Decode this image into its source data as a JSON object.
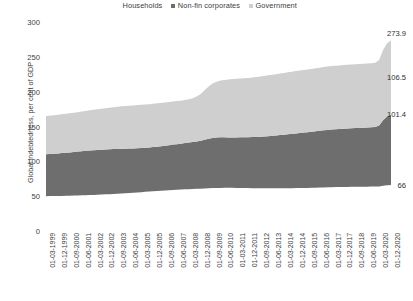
{
  "legend": {
    "position": "top-center",
    "items": [
      {
        "label": "Households",
        "color": "#ffffff",
        "swatch_name": "legend-swatch-households"
      },
      {
        "label": "Non-fin corporates",
        "color": "#6e6e6e",
        "swatch_name": "legend-swatch-non-fin-corporates"
      },
      {
        "label": "Government",
        "color": "#cfcfcf",
        "swatch_name": "legend-swatch-government"
      }
    ]
  },
  "axes": {
    "ylabel": "Global indebtedness, per cent of GDP",
    "yticks": [
      "300",
      "250",
      "200",
      "150",
      "100",
      "50",
      "0"
    ],
    "ylim": [
      0,
      300
    ],
    "xlabel": ""
  },
  "callouts": [
    {
      "name": "callout-total",
      "value": "273.9"
    },
    {
      "name": "callout-government",
      "value": "106.5"
    },
    {
      "name": "callout-non-fin-corporates",
      "value": "101.4"
    },
    {
      "name": "callout-households",
      "value": "66"
    }
  ],
  "chart_data": {
    "type": "area",
    "stacked": true,
    "title": "",
    "xlabel": "",
    "ylabel": "Global indebtedness, per cent of GDP",
    "ylim": [
      0,
      300
    ],
    "grid": false,
    "legend_position": "top-center",
    "annotations": [
      "273.9",
      "106.5",
      "101.4",
      "66"
    ],
    "tick_labels": [
      "01-03-1999",
      "01-12-1999",
      "01-09-2000",
      "01-06-2001",
      "01-03-2002",
      "01-12-2002",
      "01-09-2003",
      "01-06-2004",
      "01-03-2005",
      "01-12-2005",
      "01-09-2006",
      "01-06-2007",
      "01-03-2008",
      "01-12-2008",
      "01-09-2009",
      "01-06-2010",
      "01-03-2011",
      "01-12-2011",
      "01-09-2012",
      "01-06-2013",
      "01-03-2014",
      "01-12-2014",
      "01-09-2015",
      "01-06-2016",
      "01-03-2017",
      "01-12-2017",
      "01-09-2018",
      "01-06-2019",
      "01-03-2020",
      "01-12-2020"
    ],
    "tick_every_n_points": 3,
    "x": [
      "01-03-1999",
      "01-06-1999",
      "01-09-1999",
      "01-12-1999",
      "01-03-2000",
      "01-06-2000",
      "01-09-2000",
      "01-12-2000",
      "01-03-2001",
      "01-06-2001",
      "01-09-2001",
      "01-12-2001",
      "01-03-2002",
      "01-06-2002",
      "01-09-2002",
      "01-12-2002",
      "01-03-2003",
      "01-06-2003",
      "01-09-2003",
      "01-12-2003",
      "01-03-2004",
      "01-06-2004",
      "01-09-2004",
      "01-12-2004",
      "01-03-2005",
      "01-06-2005",
      "01-09-2005",
      "01-12-2005",
      "01-03-2006",
      "01-06-2006",
      "01-09-2006",
      "01-12-2006",
      "01-03-2007",
      "01-06-2007",
      "01-09-2007",
      "01-12-2007",
      "01-03-2008",
      "01-06-2008",
      "01-09-2008",
      "01-12-2008",
      "01-03-2009",
      "01-06-2009",
      "01-09-2009",
      "01-12-2009",
      "01-03-2010",
      "01-06-2010",
      "01-09-2010",
      "01-12-2010",
      "01-03-2011",
      "01-06-2011",
      "01-09-2011",
      "01-12-2011",
      "01-03-2012",
      "01-06-2012",
      "01-09-2012",
      "01-12-2012",
      "01-03-2013",
      "01-06-2013",
      "01-09-2013",
      "01-12-2013",
      "01-03-2014",
      "01-06-2014",
      "01-09-2014",
      "01-12-2014",
      "01-03-2015",
      "01-06-2015",
      "01-09-2015",
      "01-12-2015",
      "01-03-2016",
      "01-06-2016",
      "01-09-2016",
      "01-12-2016",
      "01-03-2017",
      "01-06-2017",
      "01-09-2017",
      "01-12-2017",
      "01-03-2018",
      "01-06-2018",
      "01-09-2018",
      "01-12-2018",
      "01-03-2019",
      "01-06-2019",
      "01-09-2019",
      "01-12-2019",
      "01-03-2020",
      "01-06-2020",
      "01-09-2020",
      "01-12-2020"
    ],
    "series": [
      {
        "name": "Households",
        "color": "#ffffff",
        "final_value": 66,
        "values": [
          50.0,
          50.1,
          50.2,
          50.3,
          50.4,
          50.5,
          50.6,
          50.8,
          51.0,
          51.2,
          51.4,
          51.6,
          51.8,
          52.0,
          52.3,
          52.6,
          52.9,
          53.2,
          53.5,
          53.9,
          54.2,
          54.6,
          55.0,
          55.4,
          55.8,
          56.2,
          56.6,
          57.0,
          57.4,
          57.8,
          58.2,
          58.6,
          59.0,
          59.3,
          59.6,
          59.9,
          60.1,
          60.3,
          60.5,
          60.7,
          61.0,
          61.3,
          61.6,
          61.8,
          61.9,
          62.0,
          62.0,
          62.0,
          61.9,
          61.8,
          61.7,
          61.6,
          61.5,
          61.4,
          61.3,
          61.2,
          61.2,
          61.2,
          61.2,
          61.3,
          61.3,
          61.4,
          61.5,
          61.6,
          61.7,
          61.8,
          61.9,
          62.0,
          62.1,
          62.3,
          62.5,
          62.7,
          62.9,
          63.0,
          63.1,
          63.2,
          63.3,
          63.4,
          63.5,
          63.5,
          63.6,
          63.6,
          63.7,
          63.8,
          64.0,
          64.8,
          65.5,
          66.0
        ]
      },
      {
        "name": "Non-fin corporates",
        "color": "#6e6e6e",
        "final_value": 101.4,
        "values": [
          60.0,
          60.3,
          60.6,
          61.0,
          61.4,
          61.8,
          62.2,
          62.6,
          63.0,
          63.4,
          63.8,
          64.0,
          64.2,
          64.3,
          64.4,
          64.5,
          64.5,
          64.4,
          64.3,
          64.2,
          64.0,
          63.8,
          63.6,
          63.5,
          63.4,
          63.3,
          63.3,
          63.4,
          63.6,
          63.9,
          64.2,
          64.6,
          65.0,
          65.4,
          65.8,
          66.3,
          66.8,
          67.4,
          68.0,
          68.8,
          70.0,
          71.2,
          72.0,
          72.4,
          72.5,
          72.4,
          72.3,
          72.3,
          72.4,
          72.6,
          72.8,
          73.0,
          73.3,
          73.6,
          74.0,
          74.4,
          74.9,
          75.4,
          75.9,
          76.4,
          77.0,
          77.5,
          78.0,
          78.5,
          79.0,
          79.5,
          80.0,
          80.5,
          81.0,
          81.5,
          82.0,
          82.4,
          82.8,
          83.1,
          83.4,
          83.6,
          83.8,
          84.0,
          84.2,
          84.4,
          84.6,
          84.9,
          85.2,
          85.6,
          87.5,
          94.0,
          99.0,
          101.4
        ]
      },
      {
        "name": "Government",
        "color": "#cfcfcf",
        "final_value": 106.5,
        "values": [
          55.0,
          55.2,
          55.4,
          55.6,
          55.8,
          56.0,
          56.2,
          56.4,
          56.6,
          56.9,
          57.2,
          57.6,
          58.0,
          58.4,
          58.8,
          59.2,
          59.6,
          60.0,
          60.4,
          60.8,
          61.1,
          61.4,
          61.6,
          61.8,
          62.0,
          62.1,
          62.2,
          62.3,
          62.3,
          62.2,
          62.1,
          62.0,
          61.9,
          61.8,
          61.7,
          61.8,
          62.2,
          63.0,
          64.5,
          67.0,
          71.0,
          75.0,
          78.0,
          80.0,
          81.5,
          82.5,
          83.2,
          83.8,
          84.2,
          84.5,
          84.8,
          85.0,
          85.4,
          85.9,
          86.4,
          86.9,
          87.3,
          87.6,
          87.9,
          88.2,
          88.5,
          88.8,
          89.1,
          89.4,
          89.6,
          89.8,
          90.0,
          90.2,
          90.4,
          90.6,
          90.8,
          90.9,
          91.0,
          91.1,
          91.2,
          91.3,
          91.4,
          91.5,
          91.6,
          91.7,
          91.8,
          91.9,
          92.0,
          92.2,
          94.0,
          101.0,
          105.0,
          106.5
        ]
      }
    ],
    "totals_final": 273.9
  }
}
